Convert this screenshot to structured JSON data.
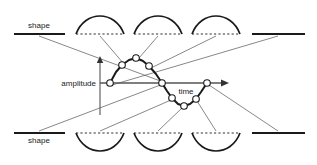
{
  "figure": {
    "type": "waveform-annotation-diagram",
    "background_color": "#ffffff",
    "stroke_color": "#1a1a1a",
    "axis_color": "#555555",
    "leader_color": "#555555",
    "marker_fill": "#ffffff",
    "width": 317,
    "height": 165
  },
  "labels": {
    "shape_top": "shape",
    "shape_bottom": "shape",
    "amplitude": "amplitude",
    "time": "time"
  },
  "axes": {
    "amplitude_axis": {
      "label": "amplitude",
      "orientation": "vertical",
      "arrow": "up",
      "x": 100,
      "y_top": 57,
      "y_bottom": 115
    },
    "time_axis": {
      "label": "time",
      "orientation": "horizontal",
      "arrow": "right",
      "y": 83,
      "x_left": 100,
      "x_right": 228
    }
  },
  "waveform": {
    "description": "sampled sine wave with circular sample markers",
    "baseline_y": 83,
    "amplitude_px": 26,
    "markers": [
      {
        "x": 110,
        "y": 83
      },
      {
        "x": 122,
        "y": 65
      },
      {
        "x": 136,
        "y": 58
      },
      {
        "x": 149,
        "y": 66
      },
      {
        "x": 162,
        "y": 83
      },
      {
        "x": 172,
        "y": 98
      },
      {
        "x": 184,
        "y": 106
      },
      {
        "x": 196,
        "y": 99
      },
      {
        "x": 207,
        "y": 83
      }
    ]
  },
  "top_row": {
    "description": "row of upward half-wave arcs with dashed chords, flanked by flat dashes",
    "baseline_y": 34,
    "flat_left": {
      "x1": 14,
      "x2": 65
    },
    "flat_right": {
      "x1": 252,
      "x2": 305
    },
    "arcs": [
      {
        "x1": 76,
        "x2": 124,
        "peak_y": 11
      },
      {
        "x1": 134,
        "x2": 182,
        "peak_y": 11
      },
      {
        "x1": 192,
        "x2": 240,
        "peak_y": 11
      }
    ]
  },
  "bottom_row": {
    "description": "row of downward half-wave arcs with dashed chords, flanked by flat dashes",
    "baseline_y": 133,
    "flat_left": {
      "x1": 14,
      "x2": 65
    },
    "flat_right": {
      "x1": 252,
      "x2": 305
    },
    "arcs": [
      {
        "x1": 76,
        "x2": 124,
        "trough_y": 157
      },
      {
        "x1": 134,
        "x2": 182,
        "trough_y": 157
      },
      {
        "x1": 192,
        "x2": 240,
        "trough_y": 157
      }
    ]
  },
  "leader_lines": {
    "count": 10,
    "description": "thin diagonal lines connecting each shape glyph to a sample marker on the waveform"
  }
}
